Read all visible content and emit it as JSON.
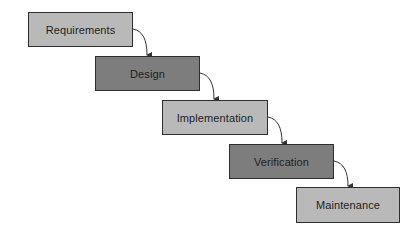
{
  "diagram": {
    "type": "waterfall",
    "colors": {
      "light_fill": "#b9b9b9",
      "dark_fill": "#7d7d7d",
      "border": "#2e2e2e",
      "arrow": "#333333"
    },
    "stages": [
      {
        "label": "Requirements",
        "shade": "light"
      },
      {
        "label": "Design",
        "shade": "dark"
      },
      {
        "label": "Implementation",
        "shade": "light"
      },
      {
        "label": "Verification",
        "shade": "dark"
      },
      {
        "label": "Maintenance",
        "shade": "light"
      }
    ],
    "edges": [
      {
        "from": "Requirements",
        "to": "Design"
      },
      {
        "from": "Design",
        "to": "Implementation"
      },
      {
        "from": "Implementation",
        "to": "Verification"
      },
      {
        "from": "Verification",
        "to": "Maintenance"
      }
    ]
  }
}
